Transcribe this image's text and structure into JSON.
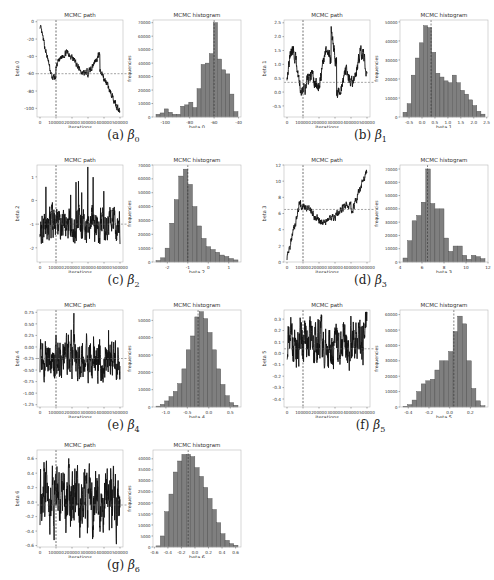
{
  "figure": {
    "panels": [
      {
        "id": "a",
        "label": "(a)",
        "symbol": "β",
        "subscript": "0",
        "path": {
          "title": "MCMC path",
          "xlabel": "iterations",
          "ylabel": "beta 0",
          "xticks": [
            "0",
            "100000",
            "200000",
            "300000",
            "400000",
            "500000"
          ],
          "yticks": [
            "0",
            "-20",
            "-40",
            "-60",
            "-80",
            "-100"
          ],
          "ylim": [
            -110,
            2
          ],
          "mean_line": -60,
          "burnin_line": 100000
        },
        "hist": {
          "title": "MCMC histogram",
          "xlabel": "beta 0",
          "ylabel": "frequencies",
          "xticks": [
            "-100",
            "-80",
            "-60",
            "-40"
          ],
          "yticks": [
            "0",
            "10000",
            "20000",
            "30000",
            "40000",
            "50000",
            "60000",
            "70000"
          ],
          "xlim": [
            -110,
            -38
          ],
          "ymax": 72000,
          "bins": [
            -108,
            -104,
            -100,
            -96,
            -92,
            -88,
            -84,
            -80,
            -76,
            -72,
            -68,
            -64,
            -60,
            -56,
            -52,
            -48,
            -44,
            -40
          ],
          "counts": [
            2000,
            3000,
            6000,
            3500,
            2000,
            2000,
            8000,
            9000,
            11000,
            7000,
            21000,
            39000,
            40000,
            47000,
            70000,
            43000,
            35000,
            32000,
            17000,
            4000
          ],
          "mean_line": -60
        }
      },
      {
        "id": "b",
        "label": "(b)",
        "symbol": "β",
        "subscript": "1",
        "path": {
          "title": "MCMC path",
          "xlabel": "iterations",
          "ylabel": "beta 1",
          "xticks": [
            "0",
            "100000",
            "200000",
            "300000",
            "400000",
            "500000"
          ],
          "yticks": [
            "-0.5",
            "0.0",
            "0.5",
            "1.0",
            "1.5",
            "2.0",
            "2.5"
          ],
          "ylim": [
            -0.9,
            2.6
          ],
          "mean_line": 0.35,
          "burnin_line": 100000
        },
        "hist": {
          "title": "MCMC histogram",
          "xlabel": "beta 1",
          "ylabel": "frequencies",
          "xticks": [
            "-0.5",
            "0.0",
            "0.5",
            "1.0",
            "1.5",
            "2.0",
            "2.5"
          ],
          "yticks": [
            "0",
            "10000",
            "20000",
            "30000",
            "40000",
            "50000"
          ],
          "xlim": [
            -0.85,
            2.55
          ],
          "ymax": 51000,
          "counts": [
            2500,
            7000,
            22000,
            31000,
            39000,
            48000,
            47000,
            34000,
            23000,
            21000,
            19000,
            18000,
            22000,
            18000,
            14000,
            12000,
            9000,
            6000,
            3000,
            1500
          ],
          "mean_line": 0.35
        }
      },
      {
        "id": "c",
        "label": "(c)",
        "symbol": "β",
        "subscript": "2",
        "path": {
          "title": "MCMC path",
          "xlabel": "iterations",
          "ylabel": "beta 2",
          "xticks": [
            "0",
            "100000",
            "200000",
            "300000",
            "400000",
            "500000"
          ],
          "yticks": [
            "1",
            "0",
            "-1",
            "-2"
          ],
          "ylim": [
            -2.6,
            1.5
          ],
          "mean_line": -1.0,
          "burnin_line": 100000
        },
        "hist": {
          "title": "MCMC histogram",
          "xlabel": "beta 2",
          "ylabel": "frequencies",
          "xticks": [
            "-2",
            "-1",
            "0",
            "1"
          ],
          "yticks": [
            "0",
            "10000",
            "20000",
            "30000",
            "40000",
            "50000",
            "60000",
            "70000"
          ],
          "xlim": [
            -2.7,
            1.6
          ],
          "ymax": 70000,
          "counts": [
            1000,
            3000,
            10000,
            28000,
            45000,
            62000,
            67000,
            56000,
            40000,
            26000,
            17000,
            11000,
            9000,
            7000,
            5000,
            4000,
            2500,
            1500
          ],
          "mean_line": -1.0
        }
      },
      {
        "id": "d",
        "label": "(d)",
        "symbol": "β",
        "subscript": "3",
        "path": {
          "title": "MCMC path",
          "xlabel": "iterations",
          "ylabel": "beta 3",
          "xticks": [
            "0",
            "100000",
            "200000",
            "300000",
            "400000",
            "500000"
          ],
          "yticks": [
            "0",
            "2",
            "4",
            "6",
            "8",
            "10",
            "12"
          ],
          "ylim": [
            0,
            12
          ],
          "mean_line": 6.5,
          "burnin_line": 100000
        },
        "hist": {
          "title": "MCMC histogram",
          "xlabel": "beta 3",
          "ylabel": "frequencies",
          "xticks": [
            "4",
            "6",
            "8",
            "10",
            "12"
          ],
          "yticks": [
            "0",
            "10000",
            "20000",
            "30000",
            "40000",
            "50000",
            "60000",
            "70000"
          ],
          "xlim": [
            4,
            12
          ],
          "ymax": 73000,
          "counts": [
            3000,
            16000,
            31000,
            35000,
            45000,
            70000,
            44000,
            40000,
            40000,
            18000,
            8000,
            12000,
            12000,
            5000,
            2000,
            5000,
            4000,
            2500
          ],
          "mean_line": 6.5
        }
      },
      {
        "id": "e",
        "label": "(e)",
        "symbol": "β",
        "subscript": "4",
        "path": {
          "title": "MCMC path",
          "xlabel": "iterations",
          "ylabel": "beta 4",
          "xticks": [
            "0",
            "100000",
            "200000",
            "300000",
            "400000",
            "500000"
          ],
          "yticks": [
            "0.75",
            "0.50",
            "0.25",
            "0.00",
            "-0.25",
            "-0.50",
            "-0.75",
            "-1.00",
            "-1.25"
          ],
          "ylim": [
            -1.3,
            0.8
          ],
          "mean_line": -0.25,
          "burnin_line": 100000
        },
        "hist": {
          "title": "MCMC histogram",
          "xlabel": "beta 4",
          "ylabel": "frequencies",
          "xticks": [
            "-1.0",
            "-0.5",
            "0.0",
            "0.5"
          ],
          "yticks": [
            "0",
            "10000",
            "20000",
            "30000",
            "40000",
            "50000"
          ],
          "xlim": [
            -1.3,
            0.75
          ],
          "ymax": 56000,
          "counts": [
            500,
            1500,
            3500,
            6000,
            9000,
            13500,
            22000,
            33000,
            41000,
            52000,
            55000,
            51000,
            43000,
            33000,
            22000,
            13000,
            6500,
            2500,
            1000
          ],
          "mean_line": -0.25
        }
      },
      {
        "id": "f",
        "label": "(f)",
        "symbol": "β",
        "subscript": "5",
        "path": {
          "title": "MCMC path",
          "xlabel": "iterations",
          "ylabel": "beta 5",
          "xticks": [
            "0",
            "100000",
            "200000",
            "300000",
            "400000",
            "500000"
          ],
          "yticks": [
            "0.3",
            "0.2",
            "0.1",
            "0.0",
            "-0.1",
            "-0.2",
            "-0.3",
            "-0.4"
          ],
          "ylim": [
            -0.47,
            0.38
          ],
          "mean_line": 0.04,
          "burnin_line": 100000
        },
        "hist": {
          "title": "MCMC histogram",
          "xlabel": "beta 5",
          "ylabel": "frequencies",
          "xticks": [
            "-0.4",
            "-0.2",
            "0.0",
            "0.2"
          ],
          "yticks": [
            "0",
            "10000",
            "20000",
            "30000",
            "40000",
            "50000",
            "60000"
          ],
          "xlim": [
            -0.48,
            0.37
          ],
          "ymax": 63000,
          "counts": [
            500,
            1500,
            4500,
            10000,
            15000,
            17000,
            18000,
            24000,
            30000,
            30000,
            36000,
            49000,
            59000,
            54000,
            30000,
            12000,
            4000,
            800
          ],
          "mean_line": 0.04
        }
      },
      {
        "id": "g",
        "label": "(g)",
        "symbol": "β",
        "subscript": "6",
        "path": {
          "title": "MCMC path",
          "xlabel": "iterations",
          "ylabel": "beta 6",
          "xticks": [
            "0",
            "100000",
            "200000",
            "300000",
            "400000",
            "500000"
          ],
          "yticks": [
            "0.6",
            "0.4",
            "0.2",
            "0.0",
            "-0.2",
            "-0.4",
            "-0.6"
          ],
          "ylim": [
            -0.62,
            0.72
          ],
          "mean_line": -0.04,
          "burnin_line": 100000
        },
        "hist": {
          "title": "MCMC histogram",
          "xlabel": "beta 6",
          "ylabel": "frequencies",
          "xticks": [
            "-0.6",
            "-0.4",
            "-0.2",
            "0.0",
            "0.2",
            "0.4",
            "0.6"
          ],
          "yticks": [
            "0",
            "5000",
            "10000",
            "15000",
            "20000",
            "25000",
            "30000",
            "35000",
            "40000"
          ],
          "xlim": [
            -0.62,
            0.68
          ],
          "ymax": 44000,
          "counts": [
            500,
            5000,
            16000,
            24000,
            34000,
            39000,
            42000,
            42000,
            41000,
            36000,
            32000,
            27000,
            22000,
            17000,
            11000,
            6000,
            3000,
            1500,
            800
          ],
          "mean_line": -0.1
        }
      }
    ]
  },
  "chart_data": [
    {
      "type": "line",
      "panel": "a",
      "title": "MCMC path",
      "xlabel": "iterations",
      "ylabel": "beta 0",
      "xlim": [
        0,
        500000
      ],
      "ylim": [
        -110,
        2
      ],
      "description": "Trace starts near 0, drops to about -65 by 100000, wanders -40 to -70, then declines to about -108 at 500000",
      "annotations": [
        "vertical dashed line at 100000",
        "horizontal dashed line at -60"
      ]
    },
    {
      "type": "bar",
      "panel": "a",
      "title": "MCMC histogram",
      "xlabel": "beta 0",
      "ylabel": "frequencies",
      "xlim": [
        -110,
        -38
      ],
      "ylim": [
        0,
        72000
      ],
      "values": [
        2000,
        3000,
        6000,
        3500,
        2000,
        2000,
        8000,
        9000,
        11000,
        7000,
        21000,
        39000,
        40000,
        47000,
        70000,
        43000,
        35000,
        32000,
        17000,
        4000
      ]
    },
    {
      "type": "line",
      "panel": "b",
      "title": "MCMC path",
      "xlabel": "iterations",
      "ylabel": "beta 1",
      "xlim": [
        0,
        500000
      ],
      "ylim": [
        -0.9,
        2.6
      ],
      "description": "Highly autocorrelated trace oscillating between about -0.8 and 2.4",
      "annotations": [
        "vertical dashed line at 100000",
        "horizontal dashed line at 0.35"
      ]
    },
    {
      "type": "bar",
      "panel": "b",
      "title": "MCMC histogram",
      "xlabel": "beta 1",
      "ylabel": "frequencies",
      "xlim": [
        -0.85,
        2.55
      ],
      "ylim": [
        0,
        51000
      ],
      "values": [
        2500,
        7000,
        22000,
        31000,
        39000,
        48000,
        47000,
        34000,
        23000,
        21000,
        19000,
        18000,
        22000,
        18000,
        14000,
        12000,
        9000,
        6000,
        3000,
        1500
      ]
    },
    {
      "type": "line",
      "panel": "c",
      "title": "MCMC path",
      "xlabel": "iterations",
      "ylabel": "beta 2",
      "xlim": [
        0,
        500000
      ],
      "ylim": [
        -2.6,
        1.5
      ],
      "description": "Trace mostly between -2 and 0 with spikes up to about 1.3",
      "annotations": [
        "vertical dashed line at 100000",
        "horizontal dashed line at -1"
      ]
    },
    {
      "type": "bar",
      "panel": "c",
      "title": "MCMC histogram",
      "xlabel": "beta 2",
      "ylabel": "frequencies",
      "xlim": [
        -2.7,
        1.6
      ],
      "ylim": [
        0,
        70000
      ],
      "values": [
        1000,
        3000,
        10000,
        28000,
        45000,
        62000,
        67000,
        56000,
        40000,
        26000,
        17000,
        11000,
        9000,
        7000,
        5000,
        4000,
        2500,
        1500
      ]
    },
    {
      "type": "line",
      "panel": "d",
      "title": "MCMC path",
      "xlabel": "iterations",
      "ylabel": "beta 3",
      "xlim": [
        0,
        500000
      ],
      "ylim": [
        0,
        12
      ],
      "description": "Trace rises from 0 to about 7.5 by 100000, hovers 5-8, then climbs to about 11.5 at 500000",
      "annotations": [
        "vertical dashed line at 100000",
        "horizontal dashed line at 6.5"
      ]
    },
    {
      "type": "bar",
      "panel": "d",
      "title": "MCMC histogram",
      "xlabel": "beta 3",
      "ylabel": "frequencies",
      "xlim": [
        4,
        12
      ],
      "ylim": [
        0,
        73000
      ],
      "values": [
        3000,
        16000,
        31000,
        35000,
        45000,
        70000,
        44000,
        40000,
        40000,
        18000,
        8000,
        12000,
        12000,
        5000,
        2000,
        5000,
        4000,
        2500
      ]
    },
    {
      "type": "line",
      "panel": "e",
      "title": "MCMC path",
      "xlabel": "iterations",
      "ylabel": "beta 4",
      "xlim": [
        0,
        500000
      ],
      "ylim": [
        -1.3,
        0.8
      ],
      "description": "Well-mixed trace between about -1.2 and 0.6",
      "annotations": [
        "vertical dashed line at 100000",
        "horizontal dashed line at -0.25"
      ]
    },
    {
      "type": "bar",
      "panel": "e",
      "title": "MCMC histogram",
      "xlabel": "beta 4",
      "ylabel": "frequencies",
      "xlim": [
        -1.3,
        0.75
      ],
      "ylim": [
        0,
        56000
      ],
      "values": [
        500,
        1500,
        3500,
        6000,
        9000,
        13500,
        22000,
        33000,
        41000,
        52000,
        55000,
        51000,
        43000,
        33000,
        22000,
        13000,
        6500,
        2500,
        1000
      ]
    },
    {
      "type": "line",
      "panel": "f",
      "title": "MCMC path",
      "xlabel": "iterations",
      "ylabel": "beta 5",
      "xlim": [
        0,
        500000
      ],
      "ylim": [
        -0.47,
        0.38
      ],
      "description": "Trace mostly 0 to 0.25 with downward spikes to -0.45, rising to 0.35 near end",
      "annotations": [
        "vertical dashed line at 100000",
        "horizontal dashed line at 0.04"
      ]
    },
    {
      "type": "bar",
      "panel": "f",
      "title": "MCMC histogram",
      "xlabel": "beta 5",
      "ylabel": "frequencies",
      "xlim": [
        -0.48,
        0.37
      ],
      "ylim": [
        0,
        63000
      ],
      "values": [
        500,
        1500,
        4500,
        10000,
        15000,
        17000,
        18000,
        24000,
        30000,
        30000,
        36000,
        49000,
        59000,
        54000,
        30000,
        12000,
        4000,
        800
      ]
    },
    {
      "type": "line",
      "panel": "g",
      "title": "MCMC path",
      "xlabel": "iterations",
      "ylabel": "beta 6",
      "xlim": [
        0,
        500000
      ],
      "ylim": [
        -0.62,
        0.72
      ],
      "description": "Well-mixed trace between about -0.6 and 0.65",
      "annotations": [
        "vertical dashed line at 100000",
        "horizontal dashed line at -0.04"
      ]
    },
    {
      "type": "bar",
      "panel": "g",
      "title": "MCMC histogram",
      "xlabel": "beta 6",
      "ylabel": "frequencies",
      "xlim": [
        -0.62,
        0.68
      ],
      "ylim": [
        0,
        44000
      ],
      "values": [
        500,
        5000,
        16000,
        24000,
        34000,
        39000,
        42000,
        42000,
        41000,
        36000,
        32000,
        27000,
        22000,
        17000,
        11000,
        6000,
        3000,
        1500,
        800
      ]
    }
  ]
}
